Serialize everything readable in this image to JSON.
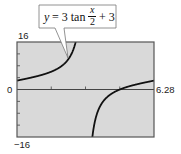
{
  "chart_data": {
    "type": "line",
    "title": "",
    "equation_label": {
      "prefix": "y = 3 tan",
      "frac_num": "x",
      "frac_den": "2",
      "suffix": "+ 3"
    },
    "function": "3*tan(x/2)+3",
    "xlim": [
      0,
      6.28
    ],
    "ylim": [
      -16,
      16
    ],
    "xticks": [
      1.57,
      3.14,
      4.71
    ],
    "yticks": [
      -12,
      -8,
      -4,
      4,
      8,
      12
    ],
    "tick_labels": {
      "ymax": "16",
      "ymin": "−16",
      "xmin": "0",
      "xmax": "6.28"
    },
    "asymptote_x": 3.14,
    "grid": false,
    "xlabel": "",
    "ylabel": ""
  },
  "colors": {
    "plot_bg": "#d9d9d9",
    "frame": "#555555",
    "curve": "#111111",
    "axis": "#444444"
  }
}
